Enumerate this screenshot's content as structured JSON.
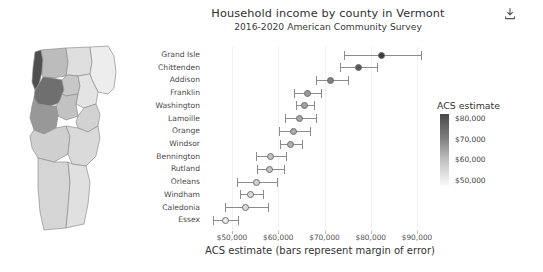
{
  "header": {
    "download_icon": "download-icon"
  },
  "chart_data": {
    "type": "scatter",
    "title": "Household income by county in Vermont",
    "subtitle": "2016-2020 American Community Survey",
    "xlabel": "ACS estimate (bars represent margin of error)",
    "ylabel": "",
    "xlim": [
      45000,
      93000
    ],
    "grid": true,
    "legend_position": "right",
    "xticks": [
      "$50,000",
      "$60,000",
      "$70,000",
      "$80,000",
      "$90,000"
    ],
    "xtick_values": [
      50000,
      60000,
      70000,
      80000,
      90000
    ],
    "categories": [
      "Grand Isle",
      "Chittenden",
      "Addison",
      "Franklin",
      "Washington",
      "Lamoille",
      "Orange",
      "Windsor",
      "Bennington",
      "Rutland",
      "Orleans",
      "Windham",
      "Caledonia",
      "Essex"
    ],
    "values": [
      82400,
      77300,
      71300,
      66300,
      65700,
      64600,
      63400,
      62600,
      58400,
      58100,
      55200,
      54100,
      53000,
      48500
    ],
    "error_low": [
      74200,
      73300,
      68200,
      63500,
      63800,
      61400,
      60100,
      60300,
      55100,
      55300,
      51000,
      51700,
      48400,
      45900
    ],
    "error_high": [
      90900,
      81400,
      75100,
      69200,
      67700,
      68200,
      66900,
      65100,
      61700,
      61300,
      59700,
      56600,
      57800,
      51300
    ],
    "marker_shades": [
      "#3a3a3a",
      "#575757",
      "#7d7d7d",
      "#9b9b9b",
      "#a0a0a0",
      "#a6a6a6",
      "#ababab",
      "#b0b0b0",
      "#c2c2c2",
      "#c4c4c4",
      "#d2d2d2",
      "#d7d7d7",
      "#dcdcdc",
      "#ececec"
    ],
    "legend": {
      "title": "ACS estimate",
      "ticks": [
        "$80,000",
        "$70,000",
        "$60,000",
        "$50,000"
      ],
      "tick_values": [
        80000,
        70000,
        60000,
        50000
      ],
      "gradient_top": "#4a4a4a",
      "gradient_bottom": "#fbfbfb"
    }
  },
  "map": {
    "name": "vermont-county-choropleth",
    "outline_color": "#8f8f8f",
    "counties": [
      {
        "name": "Grand Isle",
        "shade": "#4f4f4f"
      },
      {
        "name": "Chittenden",
        "shade": "#6f6f6f"
      },
      {
        "name": "Franklin",
        "shade": "#bcbcbc"
      },
      {
        "name": "Lamoille",
        "shade": "#c7c7c7"
      },
      {
        "name": "Orleans",
        "shade": "#dedede"
      },
      {
        "name": "Essex",
        "shade": "#ededed"
      },
      {
        "name": "Caledonia",
        "shade": "#e4e4e4"
      },
      {
        "name": "Washington",
        "shade": "#c2c2c2"
      },
      {
        "name": "Addison",
        "shade": "#989898"
      },
      {
        "name": "Orange",
        "shade": "#d2d2d2"
      },
      {
        "name": "Rutland",
        "shade": "#cfcfcf"
      },
      {
        "name": "Windsor",
        "shade": "#dadada"
      },
      {
        "name": "Bennington",
        "shade": "#d5d5d5"
      },
      {
        "name": "Windham",
        "shade": "#e0e0e0"
      }
    ]
  }
}
